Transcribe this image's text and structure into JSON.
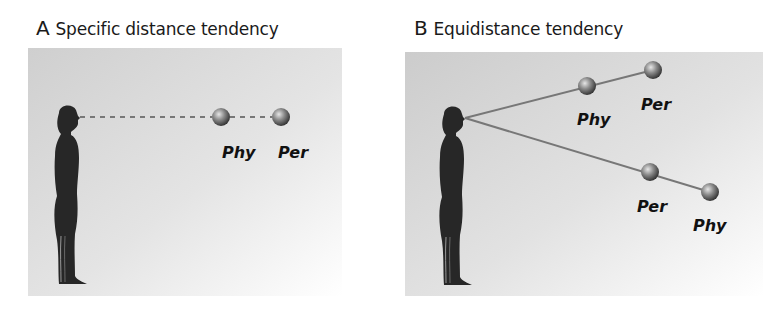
{
  "panels": [
    {
      "id": "A",
      "letter": "A",
      "title": "Specific distance tendency",
      "spheres": [
        {
          "label": "Phy"
        },
        {
          "label": "Per"
        }
      ]
    },
    {
      "id": "B",
      "letter": "B",
      "title": "Equidistance tendency",
      "spheres": [
        {
          "label": "Phy"
        },
        {
          "label": "Per"
        },
        {
          "label": "Per"
        },
        {
          "label": "Phy"
        }
      ]
    }
  ],
  "colors": {
    "background_panel": "#d4d4d4",
    "figure": "#262626",
    "line": "#7a7a7a",
    "sphere_dark": "#3a3a3a",
    "sphere_light": "#d8d8d8"
  }
}
